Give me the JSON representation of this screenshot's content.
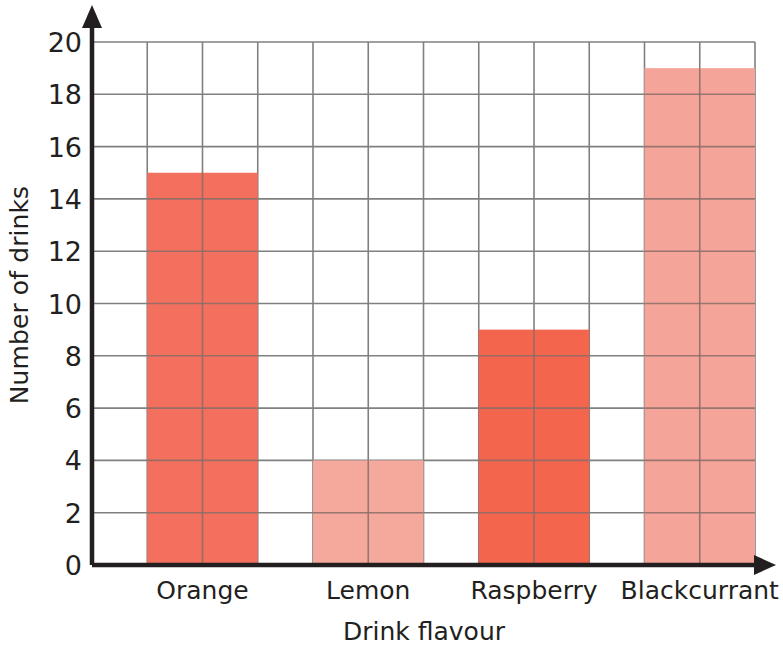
{
  "chart_data": {
    "type": "bar",
    "title": "",
    "xlabel": "Drink flavour",
    "ylabel": "Number of drinks",
    "categories": [
      "Orange",
      "Lemon",
      "Raspberry",
      "Blackcurrant"
    ],
    "values": [
      15,
      4,
      9,
      19
    ],
    "bar_colors": [
      "#f4705e",
      "#f5a89c",
      "#f4654e",
      "#f5a49a"
    ],
    "ylim": [
      0,
      20
    ],
    "y_ticks": [
      0,
      2,
      4,
      6,
      8,
      10,
      12,
      14,
      16,
      18,
      20
    ],
    "y_tick_labels": [
      "0",
      "2",
      "4",
      "6",
      "8",
      "10",
      "12",
      "14",
      "16",
      "18",
      "20"
    ],
    "grid": true,
    "grid_color": "#808080",
    "axis_color": "#231f20",
    "legend": "none",
    "series": [
      {
        "name": "Number of drinks",
        "values": [
          15,
          4,
          9,
          19
        ]
      }
    ],
    "annotations": []
  },
  "axes": {
    "y_title": "Number of drinks",
    "x_title": "Drink flavour"
  },
  "ticks": {
    "y": [
      "20",
      "18",
      "16",
      "14",
      "12",
      "10",
      "8",
      "6",
      "4",
      "2",
      "0"
    ],
    "x": [
      "Orange",
      "Lemon",
      "Raspberry",
      "Blackcurrant"
    ]
  }
}
